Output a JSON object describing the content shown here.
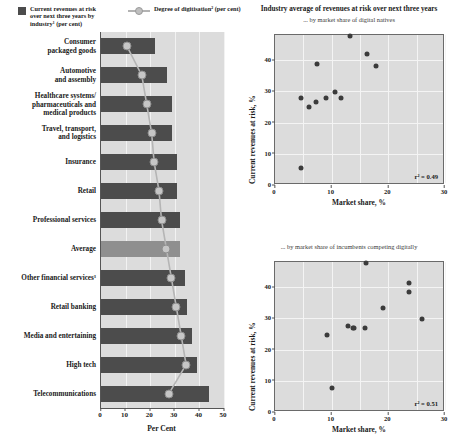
{
  "legend": {
    "bar_label": "Current revenues at risk\nover next three years by\nindustry¹ (per cent)",
    "line_label": "Degree of digitisation² (per cent)",
    "bar_color": "#4c4c4c",
    "line_color": "#bfbfbf"
  },
  "bar_chart": {
    "xlabel": "Per Cent",
    "xticks": [
      "0",
      "10",
      "20",
      "30",
      "40",
      "50"
    ]
  },
  "right": {
    "title": "Industry average of revenues at risk over next three years",
    "sub1": "... by market share of digital natives",
    "sub2": "... by market share of incumbents competing digitally",
    "ylabel": "Current revenues at risk, %",
    "xlabel": "Market share, %",
    "yticks": [
      "0",
      "10",
      "20",
      "30",
      "40"
    ],
    "xticks": [
      "0",
      "10",
      "20",
      "30"
    ],
    "r2_top": "r² = 0.49",
    "r2_bottom": "r² = 0.51"
  },
  "chart_data": [
    {
      "type": "bar",
      "title": "Current revenues at risk over next three years by industry",
      "xlabel": "Per Cent",
      "ylabel": "",
      "xlim": [
        0,
        50
      ],
      "grid": true,
      "categories": [
        "Consumer\npackaged goods",
        "Automotive\nand assembly",
        "Healthcare systems/\npharmaceuticals and\nmedical products",
        "Travel, transport,\nand logistics",
        "Insurance",
        "Retail",
        "Professional services",
        "Average",
        "Other financial services³",
        "Retail banking",
        "Media and entertaining",
        "High tech",
        "Telecommunications"
      ],
      "series": [
        {
          "name": "Current revenues at risk over next three years by industry¹ (per cent)",
          "type": "bar",
          "color": "#4c4c4c",
          "values": [
            22,
            27,
            29,
            29,
            31,
            31,
            32,
            32,
            34,
            35,
            37,
            39,
            44
          ]
        },
        {
          "name": "Degree of digitisation² (per cent)",
          "type": "line",
          "color": "#bfbfbf",
          "values": [
            11,
            17,
            19,
            21,
            22,
            24,
            25,
            27,
            29,
            31,
            33,
            35,
            28
          ]
        }
      ],
      "highlight_category": "Average",
      "highlight_color": "#8f8f8f"
    },
    {
      "type": "scatter",
      "title": "Industry average of revenues at risk over next three years",
      "subtitle": "... by market share of digital natives",
      "xlabel": "Market share, %",
      "ylabel": "Current revenues at risk, %",
      "xlim": [
        0,
        30
      ],
      "ylim": [
        0,
        48
      ],
      "xticks": [
        0,
        10,
        20,
        30
      ],
      "yticks": [
        0,
        10,
        20,
        30,
        40
      ],
      "grid": true,
      "annotation": "r² = 0.49",
      "points": [
        {
          "x": 4.6,
          "y": 5.5
        },
        {
          "x": 4.6,
          "y": 28.0
        },
        {
          "x": 6.0,
          "y": 25.0
        },
        {
          "x": 7.3,
          "y": 26.5
        },
        {
          "x": 7.4,
          "y": 38.7
        },
        {
          "x": 9.0,
          "y": 28.0
        },
        {
          "x": 10.6,
          "y": 29.7
        },
        {
          "x": 11.7,
          "y": 28.0
        },
        {
          "x": 13.2,
          "y": 47.8
        },
        {
          "x": 16.3,
          "y": 41.8
        },
        {
          "x": 17.8,
          "y": 38.0
        }
      ]
    },
    {
      "type": "scatter",
      "title": "Industry average of revenues at risk over next three years",
      "subtitle": "... by market share of incumbents competing digitally",
      "xlabel": "Market share, %",
      "ylabel": "Current revenues at risk, %",
      "xlim": [
        0,
        30
      ],
      "ylim": [
        0,
        48
      ],
      "xticks": [
        0,
        10,
        20,
        30
      ],
      "yticks": [
        0,
        10,
        20,
        30,
        40
      ],
      "grid": true,
      "annotation": "r² = 0.51",
      "points": [
        {
          "x": 9.2,
          "y": 24.7
        },
        {
          "x": 10.0,
          "y": 7.8
        },
        {
          "x": 12.9,
          "y": 27.4
        },
        {
          "x": 13.7,
          "y": 27.0
        },
        {
          "x": 14.0,
          "y": 26.8
        },
        {
          "x": 15.8,
          "y": 26.9
        },
        {
          "x": 16.1,
          "y": 47.8
        },
        {
          "x": 19.0,
          "y": 33.4
        },
        {
          "x": 23.6,
          "y": 41.4
        },
        {
          "x": 23.6,
          "y": 38.3
        },
        {
          "x": 25.9,
          "y": 29.8
        }
      ]
    }
  ]
}
